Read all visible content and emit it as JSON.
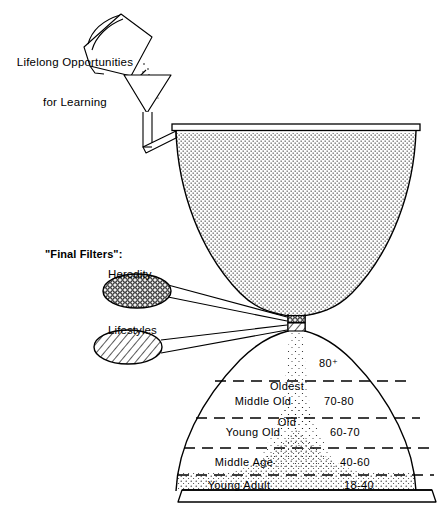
{
  "figure": {
    "title_text": "Lifelong Opportunities for Learning hourglass diagram",
    "background_color": "#ffffff",
    "ink_color": "#000000"
  },
  "watering_can": {
    "label_line1": "Lifelong Opportunities",
    "label_line2": "for Learning",
    "label": "Lifelong Opportunities\nfor Learning"
  },
  "filters": {
    "heading": "\"Final Filters\":",
    "items": [
      {
        "label": "Heredity",
        "pattern": "dotted-mesh"
      },
      {
        "label": "Lifestyles",
        "pattern": "diagonal-hatch"
      }
    ]
  },
  "age_bands": [
    {
      "name": "Oldest\nOld",
      "name_line1": "Oldest",
      "name_line2": "Old",
      "range": "80⁺"
    },
    {
      "name": "Middle Old",
      "range": "70-80"
    },
    {
      "name": "Young Old",
      "range": "60-70"
    },
    {
      "name": "Middle Age",
      "range": "40-60"
    },
    {
      "name": "Young Adult",
      "range": "18-40"
    }
  ]
}
